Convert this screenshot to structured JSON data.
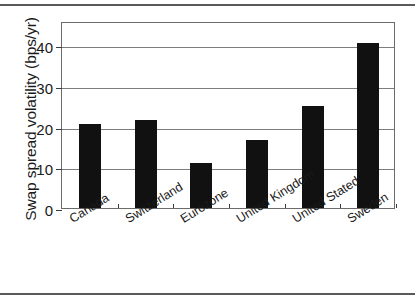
{
  "chart_data": {
    "type": "bar",
    "title": "",
    "xlabel": "",
    "ylabel": "Swap spread volatility (bps/yr)",
    "categories": [
      "Canada",
      "Switzerland",
      "Eurozone",
      "United Kingdom",
      "United Stated",
      "Sweden"
    ],
    "values": [
      20.7,
      21.7,
      11.0,
      16.8,
      25.0,
      40.5
    ],
    "ylim": [
      0,
      46
    ],
    "yticks": [
      0,
      10,
      20,
      30,
      40
    ],
    "ytick_labels": [
      "0",
      "10",
      "20",
      "30",
      "40"
    ],
    "grid": true,
    "legend": false,
    "bar_color": "#111111",
    "frame_color": "#6b6b6b",
    "gridline_color": "#7d7d7d",
    "rule_color": "#595959"
  }
}
